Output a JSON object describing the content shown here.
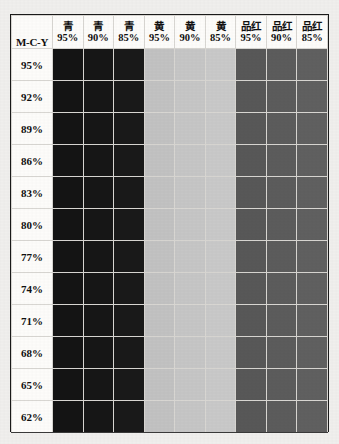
{
  "document": {
    "kind": "ink-density-test-chart",
    "corner_label": "M-C-Y",
    "background_color": "#f0efed",
    "table_background": "#fdfcfa",
    "border_color": "#1a1a1a"
  },
  "columns": [
    {
      "ink": "青",
      "percent": "95%",
      "color": "#141414"
    },
    {
      "ink": "青",
      "percent": "90%",
      "color": "#161616"
    },
    {
      "ink": "青",
      "percent": "85%",
      "color": "#191919"
    },
    {
      "ink": "黄",
      "percent": "95%",
      "color": "#c2c2c2"
    },
    {
      "ink": "黄",
      "percent": "90%",
      "color": "#c6c6c6"
    },
    {
      "ink": "黄",
      "percent": "85%",
      "color": "#c9c9c9"
    },
    {
      "ink": "品红",
      "percent": "95%",
      "color": "#585858"
    },
    {
      "ink": "品红",
      "percent": "90%",
      "color": "#5c5c5c"
    },
    {
      "ink": "品红",
      "percent": "85%",
      "color": "#606060"
    }
  ],
  "rows": [
    {
      "label": "95%"
    },
    {
      "label": "92%"
    },
    {
      "label": "89%"
    },
    {
      "label": "86%"
    },
    {
      "label": "83%"
    },
    {
      "label": "80%"
    },
    {
      "label": "77%"
    },
    {
      "label": "74%"
    },
    {
      "label": "71%"
    },
    {
      "label": "68%"
    },
    {
      "label": "65%"
    },
    {
      "label": "62%"
    }
  ],
  "chart_data": {
    "type": "heatmap",
    "xlabel": "Ink / tint percentage",
    "ylabel": "M-C-Y percentage",
    "grid": true,
    "legend": "none",
    "categories": [
      "青 95%",
      "青 90%",
      "青 85%",
      "黄 95%",
      "黄 90%",
      "黄 85%",
      "品红 95%",
      "品红 90%",
      "品红 85%"
    ],
    "y": [
      "95%",
      "92%",
      "89%",
      "86%",
      "83%",
      "80%",
      "77%",
      "74%",
      "71%",
      "68%",
      "65%",
      "62%"
    ],
    "series": [
      {
        "name": "95%",
        "values": [
          "#141414",
          "#161616",
          "#191919",
          "#c2c2c2",
          "#c6c6c6",
          "#c9c9c9",
          "#585858",
          "#5c5c5c",
          "#606060"
        ]
      },
      {
        "name": "92%",
        "values": [
          "#141414",
          "#161616",
          "#191919",
          "#c2c2c2",
          "#c6c6c6",
          "#c9c9c9",
          "#585858",
          "#5c5c5c",
          "#606060"
        ]
      },
      {
        "name": "89%",
        "values": [
          "#141414",
          "#161616",
          "#191919",
          "#c2c2c2",
          "#c6c6c6",
          "#c9c9c9",
          "#585858",
          "#5c5c5c",
          "#606060"
        ]
      },
      {
        "name": "86%",
        "values": [
          "#141414",
          "#161616",
          "#191919",
          "#c2c2c2",
          "#c6c6c6",
          "#c9c9c9",
          "#585858",
          "#5c5c5c",
          "#606060"
        ]
      },
      {
        "name": "83%",
        "values": [
          "#141414",
          "#161616",
          "#191919",
          "#c2c2c2",
          "#c6c6c6",
          "#c9c9c9",
          "#585858",
          "#5c5c5c",
          "#606060"
        ]
      },
      {
        "name": "80%",
        "values": [
          "#141414",
          "#161616",
          "#191919",
          "#c2c2c2",
          "#c6c6c6",
          "#c9c9c9",
          "#585858",
          "#5c5c5c",
          "#606060"
        ]
      },
      {
        "name": "77%",
        "values": [
          "#141414",
          "#161616",
          "#191919",
          "#c2c2c2",
          "#c6c6c6",
          "#c9c9c9",
          "#585858",
          "#5c5c5c",
          "#606060"
        ]
      },
      {
        "name": "74%",
        "values": [
          "#141414",
          "#161616",
          "#191919",
          "#c2c2c2",
          "#c6c6c6",
          "#c9c9c9",
          "#585858",
          "#5c5c5c",
          "#606060"
        ]
      },
      {
        "name": "71%",
        "values": [
          "#141414",
          "#161616",
          "#191919",
          "#c2c2c2",
          "#c6c6c6",
          "#c9c9c9",
          "#585858",
          "#5c5c5c",
          "#606060"
        ]
      },
      {
        "name": "68%",
        "values": [
          "#141414",
          "#161616",
          "#191919",
          "#c2c2c2",
          "#c6c6c6",
          "#c9c9c9",
          "#585858",
          "#5c5c5c",
          "#606060"
        ]
      },
      {
        "name": "65%",
        "values": [
          "#141414",
          "#161616",
          "#191919",
          "#c2c2c2",
          "#c6c6c6",
          "#c9c9c9",
          "#585858",
          "#5c5c5c",
          "#606060"
        ]
      },
      {
        "name": "62%",
        "values": [
          "#141414",
          "#161616",
          "#191919",
          "#c2c2c2",
          "#c6c6c6",
          "#c9c9c9",
          "#585858",
          "#5c5c5c",
          "#606060"
        ]
      }
    ]
  }
}
